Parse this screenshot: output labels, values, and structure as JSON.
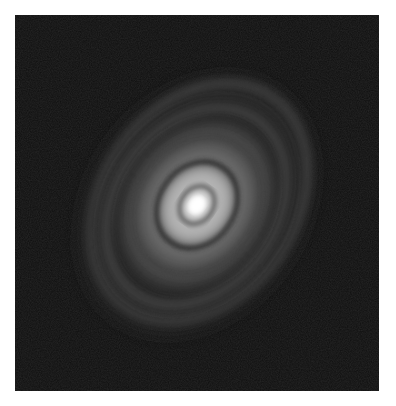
{
  "image": {
    "subject": "grayscale image of bright central source surrounded by concentric tilted elliptical rings",
    "background_color": "#0d0d0d",
    "border_color": "#ffffff",
    "core_color": "#ffffff"
  }
}
